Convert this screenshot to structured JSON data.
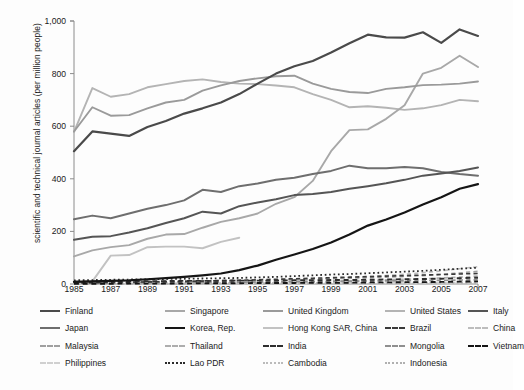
{
  "chart": {
    "type": "line",
    "ylabel": "scientific and technical journal articles (per million people)",
    "xlabel": "",
    "ylim": [
      0,
      1000
    ],
    "yticks": [
      "0",
      "200",
      "400",
      "600",
      "800",
      "1,000"
    ],
    "ytick_values": [
      0,
      200,
      400,
      600,
      800,
      1000
    ],
    "xlim": [
      1985,
      2007
    ],
    "xticks": [
      "1985",
      "1987",
      "1989",
      "1991",
      "1993",
      "1995",
      "1997",
      "1999",
      "2001",
      "2003",
      "2005",
      "2007"
    ],
    "xtick_values": [
      1985,
      1987,
      1989,
      1991,
      1993,
      1995,
      1997,
      1999,
      2001,
      2003,
      2005,
      2007
    ],
    "grid": false,
    "legend_position": "bottom"
  },
  "chart_data": {
    "type": "line",
    "title": "",
    "xlabel": "",
    "ylabel": "scientific and technical journal articles (per million people)",
    "ylim": [
      0,
      1000
    ],
    "x": [
      1985,
      1986,
      1987,
      1988,
      1989,
      1990,
      1991,
      1992,
      1993,
      1994,
      1995,
      1996,
      1997,
      1998,
      1999,
      2000,
      2001,
      2002,
      2003,
      2004,
      2005,
      2006,
      2007
    ],
    "series": [
      {
        "name": "Finland",
        "style": "solid",
        "color": "#4a4a4a",
        "width": 2.2,
        "values": [
          505,
          580,
          572,
          563,
          597,
          620,
          648,
          668,
          690,
          722,
          762,
          800,
          828,
          848,
          880,
          915,
          948,
          938,
          937,
          957,
          917,
          968,
          943
        ]
      },
      {
        "name": "Singapore",
        "style": "solid",
        "color": "#a8a8a8",
        "width": 1.9,
        "values": [
          105,
          128,
          140,
          148,
          172,
          188,
          190,
          214,
          236,
          250,
          268,
          305,
          330,
          392,
          505,
          585,
          588,
          628,
          680,
          800,
          822,
          868,
          825
        ]
      },
      {
        "name": "United Kingdom",
        "style": "solid",
        "color": "#9a9a9a",
        "width": 1.9,
        "values": [
          580,
          672,
          640,
          642,
          668,
          690,
          700,
          735,
          755,
          772,
          782,
          790,
          792,
          762,
          742,
          730,
          726,
          742,
          748,
          756,
          758,
          762,
          770
        ]
      },
      {
        "name": "United States",
        "style": "solid",
        "color": "#b4b4b4",
        "width": 1.9,
        "values": [
          578,
          745,
          712,
          722,
          748,
          760,
          772,
          778,
          768,
          762,
          760,
          755,
          748,
          722,
          700,
          672,
          676,
          670,
          662,
          668,
          680,
          700,
          695
        ]
      },
      {
        "name": "Italy",
        "style": "solid",
        "color": "#555555",
        "width": 2.0,
        "values": [
          168,
          180,
          182,
          196,
          212,
          232,
          250,
          275,
          268,
          296,
          310,
          322,
          338,
          342,
          350,
          362,
          372,
          383,
          396,
          412,
          420,
          430,
          443
        ]
      },
      {
        "name": "Japan",
        "style": "solid",
        "color": "#6e6e6e",
        "width": 2.0,
        "values": [
          246,
          260,
          250,
          268,
          286,
          300,
          318,
          358,
          350,
          372,
          382,
          396,
          404,
          418,
          430,
          450,
          440,
          440,
          445,
          440,
          426,
          418,
          412
        ]
      },
      {
        "name": "Korea, Rep.",
        "style": "solid",
        "color": "#151515",
        "width": 2.2,
        "values": [
          8,
          10,
          12,
          14,
          18,
          22,
          27,
          33,
          40,
          53,
          70,
          92,
          112,
          133,
          158,
          188,
          222,
          245,
          272,
          302,
          330,
          362,
          380
        ]
      },
      {
        "name": "Hong Kong SAR, China",
        "style": "solid",
        "color": "#c2c2c2",
        "width": 1.9,
        "values": [
          8,
          10,
          108,
          110,
          140,
          142,
          142,
          136,
          160,
          176,
          null,
          null,
          null,
          null,
          null,
          null,
          null,
          null,
          null,
          null,
          null,
          null,
          null
        ]
      },
      {
        "name": "Brazil",
        "style": "dashed",
        "color": "#3a3a3a",
        "width": 1.6,
        "values": [
          4,
          5,
          6,
          7,
          8,
          9,
          10,
          11,
          13,
          14,
          16,
          18,
          20,
          22,
          24,
          26,
          28,
          30,
          32,
          34,
          36,
          38,
          40
        ]
      },
      {
        "name": "China",
        "style": "dashed",
        "color": "#bdbdbd",
        "width": 1.6,
        "values": [
          2,
          2,
          3,
          4,
          5,
          6,
          7,
          8,
          9,
          10,
          12,
          14,
          16,
          18,
          21,
          24,
          28,
          32,
          37,
          43,
          50,
          58,
          66
        ]
      },
      {
        "name": "Malaysia",
        "style": "dashed",
        "color": "#a0a0a0",
        "width": 1.6,
        "values": [
          6,
          7,
          8,
          8,
          9,
          10,
          11,
          12,
          13,
          14,
          15,
          16,
          17,
          18,
          20,
          22,
          24,
          26,
          29,
          32,
          36,
          42,
          48
        ]
      },
      {
        "name": "Thailand",
        "style": "dashed",
        "color": "#adadad",
        "width": 1.6,
        "values": [
          2,
          2,
          3,
          3,
          4,
          4,
          5,
          5,
          6,
          6,
          7,
          8,
          9,
          10,
          11,
          12,
          14,
          16,
          18,
          20,
          23,
          26,
          30
        ]
      },
      {
        "name": "India",
        "style": "dashed",
        "color": "#2e2e2e",
        "width": 1.9,
        "values": [
          9,
          9,
          10,
          10,
          11,
          11,
          12,
          12,
          12,
          13,
          13,
          13,
          14,
          14,
          15,
          15,
          16,
          17,
          18,
          19,
          20,
          22,
          24
        ]
      },
      {
        "name": "Mongolia",
        "style": "dashed",
        "color": "#8f8f8f",
        "width": 1.6,
        "values": [
          3,
          3,
          4,
          4,
          5,
          5,
          6,
          6,
          7,
          7,
          8,
          8,
          9,
          9,
          10,
          10,
          11,
          12,
          12,
          13,
          14,
          15,
          16
        ]
      },
      {
        "name": "Vietnam",
        "style": "dashed",
        "color": "#151515",
        "width": 1.9,
        "values": [
          1,
          1,
          1,
          2,
          2,
          2,
          2,
          3,
          3,
          3,
          4,
          4,
          4,
          5,
          5,
          5,
          6,
          6,
          7,
          7,
          8,
          9,
          10
        ]
      },
      {
        "name": "Philippines",
        "style": "dashed",
        "color": "#d0d0d0",
        "width": 1.6,
        "values": [
          2,
          2,
          2,
          2,
          2,
          2,
          3,
          3,
          3,
          3,
          3,
          3,
          3,
          4,
          4,
          4,
          4,
          4,
          5,
          5,
          5,
          6,
          6
        ]
      },
      {
        "name": "Lao PDR",
        "style": "dotted",
        "color": "#2a2a2a",
        "width": 1.8,
        "values": [
          14,
          15,
          16,
          17,
          18,
          19,
          20,
          21,
          22,
          23,
          25,
          27,
          30,
          33,
          36,
          38,
          41,
          44,
          47,
          50,
          54,
          58,
          62
        ]
      },
      {
        "name": "Cambodia",
        "style": "dotted",
        "color": "#bbbbbb",
        "width": 1.8,
        "values": [
          1,
          1,
          1,
          1,
          1,
          2,
          2,
          2,
          2,
          2,
          2,
          3,
          3,
          3,
          3,
          4,
          4,
          4,
          5,
          5,
          5,
          6,
          6
        ]
      },
      {
        "name": "Indonesia",
        "style": "dotted",
        "color": "#b0b0b0",
        "width": 1.8,
        "values": [
          1,
          1,
          1,
          1,
          1,
          1,
          1,
          2,
          2,
          2,
          2,
          2,
          2,
          2,
          3,
          3,
          3,
          3,
          3,
          4,
          4,
          4,
          4
        ]
      }
    ]
  },
  "legend": {
    "rows": [
      [
        {
          "label": "Finland",
          "color": "#4a4a4a",
          "style": "solid",
          "width": 2.4
        },
        {
          "label": "Singapore",
          "color": "#a8a8a8",
          "style": "solid",
          "width": 2.2
        },
        {
          "label": "United Kingdom",
          "color": "#9a9a9a",
          "style": "solid",
          "width": 2.2
        },
        {
          "label": "United States",
          "color": "#b4b4b4",
          "style": "solid",
          "width": 2.2
        },
        {
          "label": "Italy",
          "color": "#555555",
          "style": "solid",
          "width": 2.4
        }
      ],
      [
        {
          "label": "Japan",
          "color": "#6e6e6e",
          "style": "solid",
          "width": 2.4
        },
        {
          "label": "Korea, Rep.",
          "color": "#151515",
          "style": "solid",
          "width": 2.6
        },
        {
          "label": "Hong Kong SAR, China",
          "color": "#c2c2c2",
          "style": "solid",
          "width": 2.2
        },
        {
          "label": "Brazil",
          "color": "#3a3a3a",
          "style": "dashed",
          "width": 2.4
        },
        {
          "label": "China",
          "color": "#bdbdbd",
          "style": "dashed",
          "width": 2.2
        }
      ],
      [
        {
          "label": "Malaysia",
          "color": "#a0a0a0",
          "style": "dashed",
          "width": 2.2
        },
        {
          "label": "Thailand",
          "color": "#adadad",
          "style": "dashed",
          "width": 2.2
        },
        {
          "label": "India",
          "color": "#2e2e2e",
          "style": "dashed",
          "width": 2.6
        },
        {
          "label": "Mongolia",
          "color": "#8f8f8f",
          "style": "dashed",
          "width": 2.4
        },
        {
          "label": "Vietnam",
          "color": "#151515",
          "style": "dashed",
          "width": 2.6
        }
      ],
      [
        {
          "label": "Philippines",
          "color": "#d0d0d0",
          "style": "dashed",
          "width": 2.2
        },
        {
          "label": "Lao PDR",
          "color": "#2a2a2a",
          "style": "dotted",
          "width": 2.4
        },
        {
          "label": "Cambodia",
          "color": "#bbbbbb",
          "style": "dotted",
          "width": 2.2
        },
        {
          "label": "Indonesia",
          "color": "#b0b0b0",
          "style": "dotted",
          "width": 2.2
        }
      ]
    ]
  }
}
